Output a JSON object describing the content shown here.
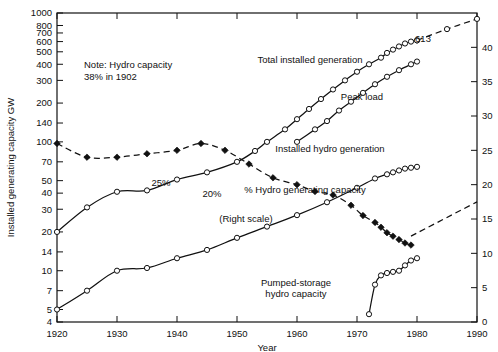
{
  "chart_data": {
    "type": "line",
    "title": "",
    "xlabel": "Year",
    "ylabel": "Installed generating capacity GW",
    "ylabel_right": "",
    "xlim": [
      1920,
      1990
    ],
    "ylim": [
      4,
      1000
    ],
    "yscale": "log",
    "ylim_right": [
      0,
      45
    ],
    "grid": false,
    "legend": "inline-annotations",
    "xticks": [
      1920,
      1930,
      1940,
      1950,
      1960,
      1970,
      1980,
      1990
    ],
    "xticklabels": [
      "1920",
      "1930",
      "1940",
      "1950",
      "1960",
      "1970",
      "1980",
      "1990"
    ],
    "yticks_left": [
      4,
      5,
      7,
      10,
      14,
      20,
      30,
      40,
      50,
      70,
      100,
      140,
      200,
      300,
      400,
      500,
      600,
      700,
      800,
      1000
    ],
    "yticklabels_left": [
      "4",
      "5",
      "7",
      "10",
      "14",
      "20",
      "30",
      "40",
      "50",
      "70",
      "100",
      "140",
      "200",
      "300",
      "400",
      "500",
      "600",
      "700",
      "800",
      "1000"
    ],
    "yticks_right": [
      0,
      5,
      10,
      15,
      20,
      25,
      30,
      35,
      40
    ],
    "yticklabels_right": [
      "0",
      "5",
      "10",
      "15",
      "20",
      "25",
      "30",
      "35",
      "40"
    ],
    "note": {
      "line1": "Note:  Hydro capacity",
      "line2": "38% in 1902"
    },
    "annotations": [
      {
        "id": "total-installed-generation",
        "text": "Total installed generation",
        "x": 310,
        "y": 63
      },
      {
        "id": "peak-load",
        "text": "Peak load",
        "x": 362,
        "y": 100
      },
      {
        "id": "installed-hydro-generation",
        "text": "Installed hydro generation",
        "x": 330,
        "y": 152
      },
      {
        "id": "pct-hydro-generating-capacity",
        "text": "% Hydro generating capacity",
        "x": 305,
        "y": 193
      },
      {
        "id": "right-scale",
        "text": "(Right scale)",
        "x": 246,
        "y": 222
      },
      {
        "id": "label-25pct",
        "text": "25%",
        "x": 161,
        "y": 186
      },
      {
        "id": "label-20pct",
        "text": "20%",
        "x": 212,
        "y": 197
      },
      {
        "id": "value-613",
        "text": "613",
        "x": 423,
        "y": 42
      },
      {
        "id": "pumped-storage-l1",
        "text": "Pumped-storage",
        "x": 296,
        "y": 286
      },
      {
        "id": "pumped-storage-l2",
        "text": "hydro capacity",
        "x": 296,
        "y": 297
      }
    ],
    "series": [
      {
        "name": "Total installed generation",
        "axis": "left",
        "style": "solid",
        "marker": "open-circle",
        "points": [
          [
            1920,
            20
          ],
          [
            1925,
            31
          ],
          [
            1930,
            41
          ],
          [
            1935,
            42
          ],
          [
            1940,
            51
          ],
          [
            1945,
            58
          ],
          [
            1950,
            70
          ],
          [
            1953,
            85
          ],
          [
            1955,
            100
          ],
          [
            1958,
            125
          ],
          [
            1960,
            150
          ],
          [
            1962,
            180
          ],
          [
            1964,
            215
          ],
          [
            1966,
            255
          ],
          [
            1968,
            300
          ],
          [
            1970,
            350
          ],
          [
            1972,
            400
          ],
          [
            1974,
            450
          ],
          [
            1975,
            490
          ],
          [
            1976,
            520
          ],
          [
            1977,
            550
          ],
          [
            1978,
            580
          ],
          [
            1979,
            600
          ],
          [
            1980,
            613
          ]
        ]
      },
      {
        "name": "Peak load",
        "axis": "left",
        "style": "solid",
        "marker": "open-circle",
        "points": [
          [
            1960,
            100
          ],
          [
            1963,
            125
          ],
          [
            1965,
            145
          ],
          [
            1967,
            175
          ],
          [
            1969,
            205
          ],
          [
            1971,
            240
          ],
          [
            1973,
            280
          ],
          [
            1975,
            320
          ],
          [
            1977,
            360
          ],
          [
            1979,
            400
          ],
          [
            1980,
            420
          ]
        ]
      },
      {
        "name": "Installed hydro generation",
        "axis": "left",
        "style": "solid",
        "marker": "open-circle",
        "points": [
          [
            1920,
            5
          ],
          [
            1925,
            7
          ],
          [
            1930,
            10
          ],
          [
            1935,
            10.5
          ],
          [
            1940,
            12.5
          ],
          [
            1945,
            14.5
          ],
          [
            1950,
            18
          ],
          [
            1955,
            22
          ],
          [
            1960,
            27
          ],
          [
            1965,
            34
          ],
          [
            1970,
            44
          ],
          [
            1973,
            52
          ],
          [
            1975,
            56
          ],
          [
            1976,
            58
          ],
          [
            1977,
            60
          ],
          [
            1978,
            62
          ],
          [
            1979,
            63
          ],
          [
            1980,
            64
          ]
        ]
      },
      {
        "name": "% Hydro generating capacity",
        "axis": "right",
        "style": "dashed",
        "marker": "filled-diamond",
        "points": [
          [
            1920,
            26
          ],
          [
            1925,
            24
          ],
          [
            1930,
            24
          ],
          [
            1935,
            24.5
          ],
          [
            1940,
            25
          ],
          [
            1944,
            26
          ],
          [
            1948,
            25
          ],
          [
            1952,
            23
          ],
          [
            1956,
            21
          ],
          [
            1960,
            20
          ],
          [
            1963,
            19
          ],
          [
            1966,
            18.5
          ],
          [
            1969,
            17
          ],
          [
            1971,
            15.5
          ],
          [
            1973,
            14.5
          ],
          [
            1974,
            13.8
          ],
          [
            1975,
            13
          ],
          [
            1976,
            12.5
          ],
          [
            1977,
            12
          ],
          [
            1978,
            11.5
          ],
          [
            1979,
            11.2
          ]
        ]
      },
      {
        "name": "% Hydro generating capacity projection",
        "axis": "right",
        "style": "dashed",
        "marker": "none",
        "points": [
          [
            1979,
            12.5
          ],
          [
            1990,
            17.5
          ]
        ]
      },
      {
        "name": "Total installed generation projection",
        "axis": "left",
        "style": "dashed",
        "marker": "open-circle",
        "points": [
          [
            1980,
            613
          ],
          [
            1985,
            750
          ],
          [
            1990,
            900
          ]
        ]
      },
      {
        "name": "Pumped-storage hydro capacity",
        "axis": "left",
        "style": "solid",
        "marker": "open-circle",
        "points": [
          [
            1972,
            4.6
          ],
          [
            1973,
            7.8
          ],
          [
            1974,
            9.2
          ],
          [
            1975,
            9.6
          ],
          [
            1976,
            9.8
          ],
          [
            1977,
            10
          ],
          [
            1978,
            11
          ],
          [
            1979,
            12
          ],
          [
            1980,
            12.5
          ]
        ]
      }
    ]
  }
}
